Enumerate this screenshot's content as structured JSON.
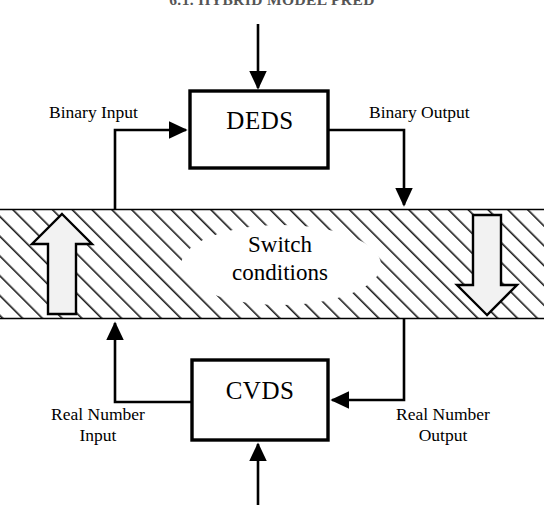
{
  "page": {
    "running_head": "6.1. HYBRID MODEL PRED",
    "width": 544,
    "height": 527,
    "background": "#ffffff"
  },
  "colors": {
    "stroke": "#000000",
    "text": "#000000",
    "hatch": "#1a1a1a",
    "band_fill": "#ffffff",
    "hollow_arrow_fill": "#f2f2f2",
    "running_head": "#555555"
  },
  "diagram": {
    "type": "block-diagram",
    "blocks": [
      {
        "id": "deds",
        "label": "DEDS",
        "x": 190,
        "y": 91,
        "width": 138,
        "height": 77
      },
      {
        "id": "cvds",
        "label": "CVDS",
        "x": 192,
        "y": 360,
        "width": 136,
        "height": 80
      }
    ],
    "band": {
      "label_line1": "Switch",
      "label_line2": "conditions",
      "x": 0,
      "y": 209,
      "width": 544,
      "height": 110,
      "hatch_direction": "bottom-left-to-top-right"
    },
    "edge_labels": [
      {
        "id": "binary-input",
        "text": "Binary Input"
      },
      {
        "id": "binary-output",
        "text": "Binary Output"
      },
      {
        "id": "real-number-input",
        "line1": "Real Number",
        "line2": "Input"
      },
      {
        "id": "real-number-output",
        "line1": "Real Number",
        "line2": "Output"
      }
    ],
    "arrows": [
      {
        "id": "external-into-deds",
        "from": "top-edge",
        "to": "deds-top",
        "style": "solid-thin"
      },
      {
        "id": "deds-to-band-right",
        "from": "deds-right",
        "to": "band-top",
        "style": "solid-thin"
      },
      {
        "id": "band-to-deds-left",
        "from": "band-top-left",
        "to": "deds-left",
        "style": "solid-thin"
      },
      {
        "id": "external-into-cvds",
        "from": "bottom-edge",
        "to": "cvds-bottom",
        "style": "solid-thin"
      },
      {
        "id": "band-to-cvds-right",
        "from": "band-bottom",
        "to": "cvds-right",
        "style": "solid-thin"
      },
      {
        "id": "cvds-to-band-left",
        "from": "cvds-left",
        "to": "band-bottom",
        "style": "solid-thin"
      },
      {
        "id": "hollow-arrow-up",
        "direction": "up",
        "style": "hollow-outline",
        "x": 50,
        "y": 210
      },
      {
        "id": "hollow-arrow-down",
        "direction": "down",
        "style": "hollow-outline",
        "x": 450,
        "y": 210
      }
    ]
  }
}
